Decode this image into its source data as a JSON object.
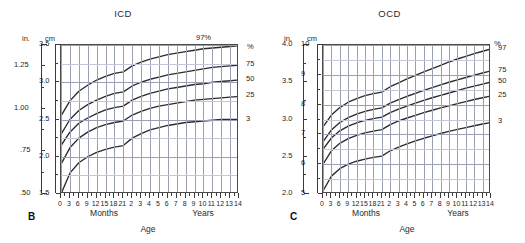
{
  "figure": {
    "background_color": "#ffffff",
    "curve_color": "#2b2b2b",
    "grid_color": "#9aa0b4",
    "axis_color": "#3a3a3a"
  },
  "panels": [
    {
      "letter": "B",
      "title": "ICD",
      "inch_unit": "in.",
      "cm_unit": "cm",
      "pct_unit": "%",
      "top_pct_label": "97%",
      "xaxis": {
        "months_label": "Months",
        "years_label": "Years",
        "caption": "Age",
        "month_ticks": [
          "0",
          "3",
          "6",
          "9",
          "12",
          "15",
          "18",
          "21"
        ],
        "year_ticks": [
          "2",
          "3",
          "4",
          "5",
          "6",
          "7",
          "8",
          "9",
          "10",
          "11",
          "12",
          "13",
          "14"
        ]
      },
      "inch_ticks": [
        "1.25",
        "1.00",
        ".75",
        ".50"
      ],
      "cm_ticks": [
        "3.5",
        "3.0",
        "2.5",
        "2.0",
        "1.5"
      ],
      "pct_right_labels": [
        "75",
        "50",
        "25",
        "3"
      ]
    },
    {
      "letter": "C",
      "title": "OCD",
      "inch_unit": "in.",
      "cm_unit": "cm",
      "pct_unit": "%",
      "top_pct_label": "",
      "xaxis": {
        "months_label": "Months",
        "years_label": "Years",
        "caption": "Age",
        "month_ticks": [
          "0",
          "3",
          "6",
          "9",
          "12",
          "15",
          "18",
          "21"
        ],
        "year_ticks": [
          "2",
          "3",
          "4",
          "5",
          "6",
          "7",
          "8",
          "9",
          "10",
          "11",
          "12",
          "13",
          "14"
        ]
      },
      "inch_ticks": [
        "4.0",
        "3.5",
        "3.0",
        "2.5",
        "2.0"
      ],
      "cm_ticks": [
        "10",
        "9",
        "8",
        "7",
        "6",
        "5"
      ],
      "pct_right_labels": [
        "97",
        "75",
        "50",
        "25",
        "3"
      ]
    }
  ],
  "chart_data": [
    {
      "type": "line",
      "title": "ICD",
      "panel": "B",
      "xlabel": "Age",
      "ylabel": "cm",
      "y2label": "in.",
      "ylim": [
        1.5,
        3.5
      ],
      "y2lim": [
        0.5,
        1.375
      ],
      "grid": true,
      "legend_position": "right",
      "x_months": [
        0,
        3,
        6,
        9,
        12,
        15,
        18,
        21
      ],
      "x_years": [
        2,
        3,
        4,
        5,
        6,
        7,
        8,
        9,
        10,
        11,
        12,
        13,
        14
      ],
      "x_ticklabels": [
        "0",
        "3",
        "6",
        "9",
        "12",
        "15",
        "18",
        "21",
        "2",
        "3",
        "4",
        "5",
        "6",
        "7",
        "8",
        "9",
        "10",
        "11",
        "12",
        "13",
        "14"
      ],
      "y_ticklabels_cm": [
        "1.5",
        "2.0",
        "2.5",
        "3.0",
        "3.5"
      ],
      "y_ticklabels_in": [
        ".50",
        ".75",
        "1.00",
        "1.25"
      ],
      "series": [
        {
          "name": "97",
          "label": "97%",
          "values_cm": [
            2.55,
            2.75,
            2.88,
            2.96,
            3.03,
            3.08,
            3.12,
            3.14,
            3.22,
            3.27,
            3.31,
            3.34,
            3.37,
            3.39,
            3.41,
            3.43,
            3.45,
            3.46,
            3.47,
            3.48,
            3.49
          ]
        },
        {
          "name": "75",
          "label": "75",
          "values_cm": [
            2.3,
            2.5,
            2.62,
            2.7,
            2.76,
            2.81,
            2.85,
            2.87,
            2.95,
            3.0,
            3.04,
            3.07,
            3.1,
            3.12,
            3.14,
            3.16,
            3.18,
            3.2,
            3.21,
            3.22,
            3.23
          ]
        },
        {
          "name": "50",
          "label": "50",
          "values_cm": [
            2.15,
            2.33,
            2.45,
            2.52,
            2.58,
            2.63,
            2.66,
            2.68,
            2.76,
            2.81,
            2.85,
            2.88,
            2.91,
            2.93,
            2.95,
            2.97,
            2.98,
            3.0,
            3.01,
            3.02,
            3.03
          ]
        },
        {
          "name": "25",
          "label": "25",
          "values_cm": [
            1.9,
            2.12,
            2.25,
            2.33,
            2.39,
            2.43,
            2.46,
            2.48,
            2.56,
            2.61,
            2.65,
            2.68,
            2.7,
            2.72,
            2.74,
            2.76,
            2.77,
            2.78,
            2.79,
            2.8,
            2.81
          ]
        },
        {
          "name": "3",
          "label": "3",
          "values_cm": [
            1.5,
            1.78,
            1.92,
            2.0,
            2.06,
            2.1,
            2.13,
            2.15,
            2.25,
            2.31,
            2.36,
            2.39,
            2.42,
            2.44,
            2.46,
            2.47,
            2.48,
            2.49,
            2.5,
            2.5,
            2.5
          ]
        }
      ]
    },
    {
      "type": "line",
      "title": "OCD",
      "panel": "C",
      "xlabel": "Age",
      "ylabel": "cm",
      "y2label": "in.",
      "ylim": [
        5,
        10
      ],
      "y2lim": [
        2.0,
        4.0
      ],
      "grid": true,
      "legend_position": "right",
      "x_months": [
        0,
        3,
        6,
        9,
        12,
        15,
        18,
        21
      ],
      "x_years": [
        2,
        3,
        4,
        5,
        6,
        7,
        8,
        9,
        10,
        11,
        12,
        13,
        14
      ],
      "x_ticklabels": [
        "0",
        "3",
        "6",
        "9",
        "12",
        "15",
        "18",
        "21",
        "2",
        "3",
        "4",
        "5",
        "6",
        "7",
        "8",
        "9",
        "10",
        "11",
        "12",
        "13",
        "14"
      ],
      "y_ticklabels_cm": [
        "5",
        "6",
        "7",
        "8",
        "9",
        "10"
      ],
      "y_ticklabels_in": [
        "2.0",
        "2.5",
        "3.0",
        "3.5",
        "4.0"
      ],
      "series": [
        {
          "name": "97",
          "label": "97",
          "values_cm": [
            7.25,
            7.65,
            7.9,
            8.08,
            8.2,
            8.3,
            8.37,
            8.42,
            8.6,
            8.73,
            8.86,
            8.98,
            9.1,
            9.21,
            9.32,
            9.43,
            9.53,
            9.62,
            9.71,
            9.79,
            9.87
          ]
        },
        {
          "name": "75",
          "label": "75",
          "values_cm": [
            6.75,
            7.15,
            7.4,
            7.56,
            7.68,
            7.77,
            7.84,
            7.89,
            8.05,
            8.17,
            8.28,
            8.38,
            8.48,
            8.57,
            8.66,
            8.75,
            8.83,
            8.91,
            8.99,
            9.06,
            9.13
          ]
        },
        {
          "name": "50",
          "label": "50",
          "values_cm": [
            6.5,
            6.88,
            7.12,
            7.28,
            7.39,
            7.47,
            7.53,
            7.58,
            7.73,
            7.85,
            7.95,
            8.05,
            8.14,
            8.23,
            8.31,
            8.39,
            8.47,
            8.55,
            8.62,
            8.69,
            8.76
          ]
        },
        {
          "name": "25",
          "label": "25",
          "values_cm": [
            6.0,
            6.45,
            6.7,
            6.86,
            6.97,
            7.05,
            7.11,
            7.16,
            7.33,
            7.45,
            7.55,
            7.64,
            7.73,
            7.81,
            7.89,
            7.96,
            8.03,
            8.1,
            8.17,
            8.23,
            8.29
          ]
        },
        {
          "name": "3",
          "label": "3",
          "values_cm": [
            5.1,
            5.6,
            5.85,
            6.0,
            6.1,
            6.17,
            6.23,
            6.27,
            6.45,
            6.57,
            6.68,
            6.78,
            6.87,
            6.95,
            7.03,
            7.1,
            7.17,
            7.23,
            7.29,
            7.35,
            7.4
          ]
        }
      ]
    }
  ]
}
